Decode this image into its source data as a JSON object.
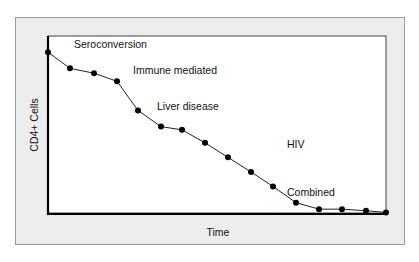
{
  "chart_data": {
    "type": "line",
    "title": "",
    "xlabel": "Time",
    "ylabel": "CD4+ Cells",
    "grid": false,
    "legend": null,
    "x": [
      0,
      1,
      2,
      3,
      4,
      5,
      6,
      7,
      8,
      9,
      10,
      11,
      12,
      13,
      14,
      15
    ],
    "series": [
      {
        "name": "CD4+ Cells",
        "values": [
          100,
          90,
          87,
          82,
          64,
          54,
          52,
          44,
          35,
          26,
          17,
          7,
          3,
          3,
          2,
          1
        ]
      }
    ],
    "annotations": [
      {
        "text": "Seroconversion",
        "x": 1.3,
        "y": 103
      },
      {
        "text": "Immune mediated",
        "x": 5.0,
        "y": 87
      },
      {
        "text": "Liver disease",
        "x": 5.0,
        "y": 66
      },
      {
        "text": "HIV",
        "x": 8.9,
        "y": 42
      },
      {
        "text": "Combined",
        "x": 10.9,
        "y": 15
      }
    ],
    "xlim": [
      0,
      15
    ],
    "ylim": [
      0,
      110
    ],
    "ticks": "none"
  },
  "labels": {
    "xlabel": "Time",
    "ylabel": "CD4+ Cells",
    "seroconversion": "Seroconversion",
    "immune": "Immune mediated",
    "liver": "Liver disease",
    "hiv": "HIV",
    "combined": "Combined"
  }
}
